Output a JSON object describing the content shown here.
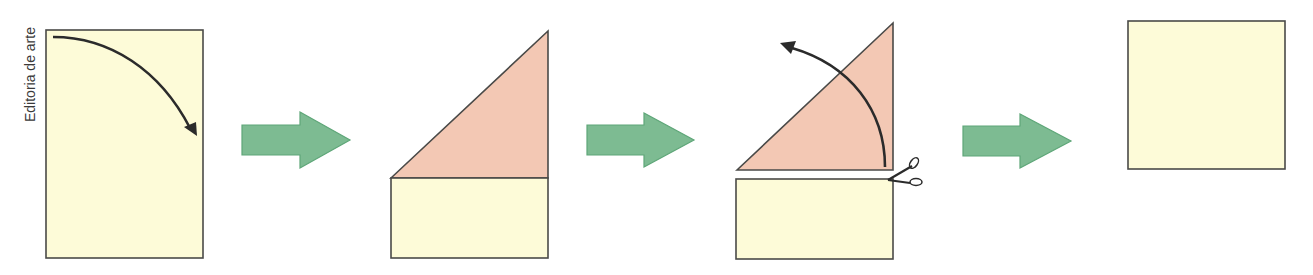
{
  "credit": "Editoria de arte",
  "colors": {
    "paper": "#fdfbd8",
    "paper_stroke": "#4a4a48",
    "fold": "#f3c8b4",
    "arrow_fill": "#7dbb92",
    "arrow_stroke": "#5ea678",
    "ink": "#2b2b2b"
  },
  "steps": [
    {
      "id": 1,
      "description": "Rectangular sheet of paper with curved arrow showing top-left corner folded down to the right edge"
    },
    {
      "id": 2,
      "description": "Top corner folded forming a triangle above a leftover rectangular strip"
    },
    {
      "id": 3,
      "description": "Leftover strip cut off with scissors; curved arrow indicates unfolding the triangle"
    },
    {
      "id": 4,
      "description": "Resulting square sheet of paper"
    }
  ],
  "transition_arrows": 3
}
